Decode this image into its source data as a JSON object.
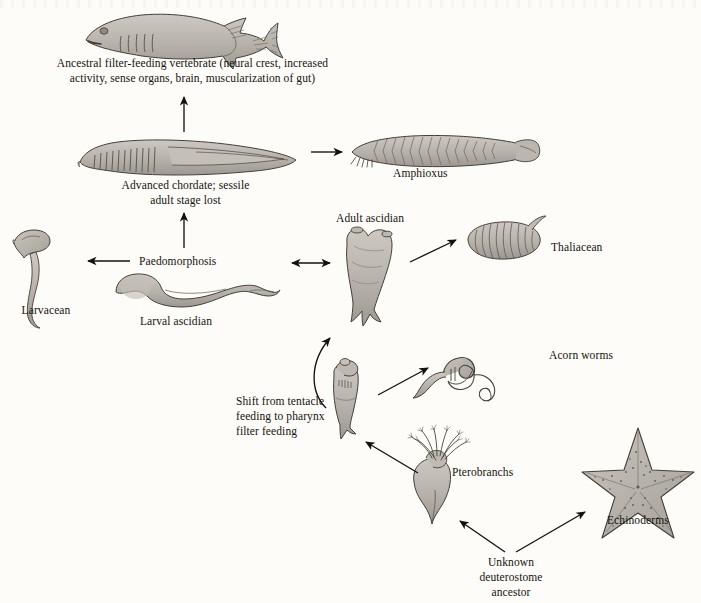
{
  "figure": {
    "domain": "biological-phylogeny-diagram",
    "title_visible": false,
    "background_color": "#fdfcf8",
    "ink_color": "#15120e",
    "organism_fill": "#b4b0a8",
    "organism_fill_light": "#c6c2ba",
    "organism_stroke": "#4a4640"
  },
  "labels": {
    "ancestral_vertebrate": "Ancestral filter-feeding vertebrate (neural crest, increased\nactivity, sense organs, brain, muscularization of gut)",
    "advanced_chordate": "Advanced chordate; sessile\nadult stage lost",
    "amphioxus": "Amphioxus",
    "paedomorphosis": "Paedomorphosis",
    "larvacean": "Larvacean",
    "larval_ascidian": "Larval ascidian",
    "adult_ascidian": "Adult ascidian",
    "thaliacean": "Thaliacean",
    "acorn_worms": "Acorn worms",
    "shift_feeding": "Shift from tentacle\nfeeding to pharynx\nfilter feeding",
    "pterobranchs": "Pterobranchs",
    "echinoderms": "Echinoderms",
    "unknown_ancestor": "Unknown\ndeuterostome\nancestor"
  },
  "organisms": [
    {
      "id": "ancestral-vertebrate",
      "label": "Ancestral filter-feeding vertebrate",
      "icon": "fish-icon"
    },
    {
      "id": "advanced-chordate",
      "label": "Advanced chordate; sessile adult stage lost",
      "icon": "lancelet-icon"
    },
    {
      "id": "amphioxus",
      "label": "Amphioxus",
      "icon": "amphioxus-icon"
    },
    {
      "id": "larvacean",
      "label": "Larvacean",
      "icon": "larvacean-icon"
    },
    {
      "id": "larval-ascidian",
      "label": "Larval ascidian",
      "icon": "tadpole-larva-icon"
    },
    {
      "id": "adult-ascidian",
      "label": "Adult ascidian",
      "icon": "sea-squirt-icon"
    },
    {
      "id": "thaliacean",
      "label": "Thaliacean",
      "icon": "salp-icon"
    },
    {
      "id": "acorn-worms",
      "label": "Acorn worms",
      "icon": "acorn-worm-icon"
    },
    {
      "id": "tentacle-feeder",
      "label": "Shift from tentacle feeding to pharynx filter feeding",
      "icon": "tentacle-feeder-icon"
    },
    {
      "id": "pterobranchs",
      "label": "Pterobranchs",
      "icon": "pterobranch-icon"
    },
    {
      "id": "echinoderms",
      "label": "Echinoderms",
      "icon": "sea-star-icon"
    }
  ],
  "arrows": [
    {
      "id": "advanced-chordate-to-ancestral-vertebrate",
      "type": "single",
      "direction": "up"
    },
    {
      "id": "advanced-chordate-to-amphioxus",
      "type": "single",
      "direction": "right"
    },
    {
      "id": "larval-ascidian-to-larvacean",
      "type": "single",
      "direction": "left"
    },
    {
      "id": "paedomorphosis-to-advanced-chordate",
      "type": "single",
      "direction": "up"
    },
    {
      "id": "larval-ascidian-to-adult-ascidian",
      "type": "double",
      "direction": "both"
    },
    {
      "id": "adult-ascidian-to-thaliacean",
      "type": "single",
      "direction": "upper-right"
    },
    {
      "id": "tentacle-feeder-to-adult-ascidian",
      "type": "curved",
      "direction": "up-curved"
    },
    {
      "id": "tentacle-feeder-to-acorn-worms",
      "type": "single",
      "direction": "upper-right"
    },
    {
      "id": "pterobranchs-to-tentacle-feeder",
      "type": "single",
      "direction": "upper-left"
    },
    {
      "id": "unknown-ancestor-to-pterobranchs",
      "type": "single",
      "direction": "upper-left"
    },
    {
      "id": "unknown-ancestor-to-echinoderms",
      "type": "single",
      "direction": "upper-right"
    }
  ]
}
